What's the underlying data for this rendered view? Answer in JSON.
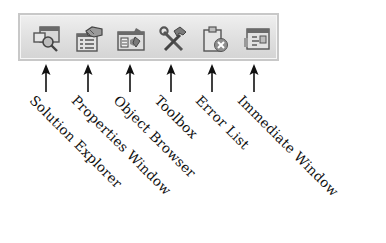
{
  "toolbar": {
    "buttons": [
      {
        "id": "solution-explorer",
        "label": "Solution Explorer",
        "icon": "solution-explorer-icon"
      },
      {
        "id": "properties-window",
        "label": "Properties Window",
        "icon": "properties-window-icon"
      },
      {
        "id": "object-browser",
        "label": "Object Browser",
        "icon": "object-browser-icon"
      },
      {
        "id": "toolbox",
        "label": "Toolbox",
        "icon": "toolbox-icon"
      },
      {
        "id": "error-list",
        "label": "Error List",
        "icon": "error-list-icon"
      },
      {
        "id": "immediate-window",
        "label": "Immediate Window",
        "icon": "immediate-window-icon"
      }
    ]
  },
  "colors": {
    "toolbar_border": "#c8c8c8",
    "toolbar_bg_top": "#efefef",
    "toolbar_bg_bottom": "#d4d4d4",
    "arrow": "#111111",
    "label_text": "#111111"
  }
}
